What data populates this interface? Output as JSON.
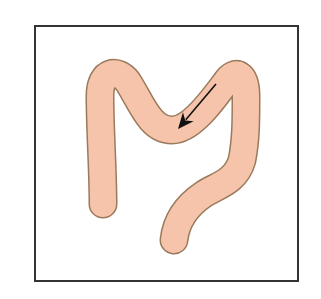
{
  "diagram": {
    "type": "anatomical-schematic",
    "frame": {
      "x": 35,
      "y": 26,
      "width": 263,
      "height": 255,
      "stroke": "#333333"
    },
    "colors": {
      "tube_fill": "#f6c4ab",
      "tube_outline": "#9a7a5c",
      "arrow": "#111111",
      "background": "#ffffff"
    },
    "tube": {
      "width": 26,
      "path": "M103,204 C103,170 100,130 100,96 C100,70 118,68 128,82 C142,104 150,130 172,130 C192,130 214,98 226,82 C236,68 246,74 246,96 C246,120 246,140 242,160 C236,182 216,186 204,194 C186,206 176,222 174,240"
    },
    "arrow": {
      "from": [
        216,
        84
      ],
      "to": [
        178,
        129
      ],
      "label": ""
    }
  }
}
